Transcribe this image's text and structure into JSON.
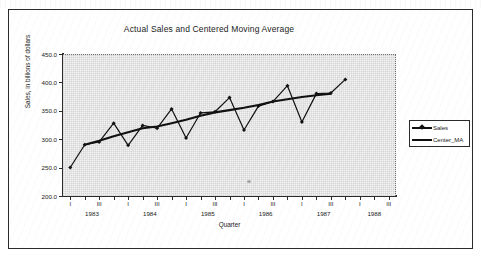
{
  "chart_data": {
    "type": "line",
    "title": "Actual Sales and Centered Moving Average",
    "xlabel": "Quarter",
    "ylabel": "Sales, in billions of dollars",
    "ylim": [
      200.0,
      450.0
    ],
    "ytick_step": 50.0,
    "ytick_labels": [
      "450.0",
      "400.0",
      "350.0",
      "300.0",
      "250.0",
      "200.0"
    ],
    "ytick_values": [
      450.0,
      400.0,
      350.0,
      300.0,
      250.0,
      200.0
    ],
    "grid": true,
    "legend_position": "right",
    "x": [
      "1983 I",
      "1983 II",
      "1983 III",
      "1983 IV",
      "1984 I",
      "1984 II",
      "1984 III",
      "1984 IV",
      "1985 I",
      "1985 II",
      "1985 III",
      "1985 IV",
      "1986 I",
      "1986 II",
      "1986 III",
      "1986 IV",
      "1987 I",
      "1987 II",
      "1987 III",
      "1987 IV",
      "1988 I",
      "1988 II",
      "1988 III"
    ],
    "quarter_tick_labels": [
      "I",
      "",
      "III",
      "",
      "I",
      "",
      "III",
      "",
      "I",
      "",
      "III",
      "",
      "I",
      "",
      "III",
      "",
      "I",
      "",
      "III",
      "",
      "I",
      "",
      "III"
    ],
    "year_labels": [
      "1983",
      "1984",
      "1985",
      "1986",
      "1987",
      "1988"
    ],
    "series": [
      {
        "name": "Sales",
        "marker": "diamond",
        "color": "#111111",
        "values": [
          252,
          292,
          297,
          330,
          291,
          326,
          321,
          355,
          304,
          348,
          350,
          375,
          318,
          360,
          368,
          396,
          332,
          382,
          383,
          407,
          null,
          null,
          null
        ]
      },
      {
        "name": "Center_MA",
        "marker": "none",
        "color": "#111111",
        "values": [
          null,
          292,
          299,
          307,
          314,
          321,
          324,
          330,
          336,
          343,
          349,
          353,
          357,
          362,
          368,
          372,
          376,
          379,
          382,
          null,
          null,
          null,
          null
        ]
      }
    ]
  },
  "legend": {
    "items": [
      {
        "label": "Sales"
      },
      {
        "label": "Center_MA"
      }
    ]
  },
  "colors": {
    "series": "#111111",
    "axis": "#2b2b2b",
    "plot_background": "#f2f2f2",
    "frame": "#2b2b2b"
  }
}
